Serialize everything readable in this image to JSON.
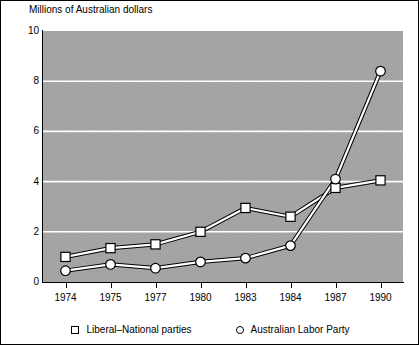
{
  "chart_data": {
    "type": "line",
    "title": "Millions of Australian dollars",
    "xlabel": "",
    "ylabel": "",
    "categories": [
      "1974",
      "1975",
      "1977",
      "1980",
      "1983",
      "1984",
      "1987",
      "1990"
    ],
    "series": [
      {
        "name": "Liberal–National parties",
        "marker": "square",
        "values": [
          1.0,
          1.35,
          1.5,
          2.0,
          2.95,
          2.6,
          3.75,
          4.05
        ]
      },
      {
        "name": "Australian Labor Party",
        "marker": "circle",
        "values": [
          0.45,
          0.7,
          0.55,
          0.8,
          0.95,
          1.45,
          4.1,
          8.4
        ]
      }
    ],
    "ylim": [
      0,
      10
    ],
    "y_ticks": [
      0,
      2,
      4,
      6,
      8,
      10
    ],
    "y_tick_labels": [
      "0",
      "2",
      "4",
      "6",
      "8",
      "10"
    ],
    "grid": "horizontal",
    "gridline_color": "#ffffff",
    "plot_background": "#a9a9a9",
    "line_color": "#ffffff",
    "line_outline_color": "#000000",
    "marker_fill": "#ffffff",
    "marker_edge": "#000000",
    "legend_position": "bottom"
  },
  "legend": {
    "entries": [
      {
        "label": "Liberal–National parties",
        "marker": "square"
      },
      {
        "label": "Australian Labor Party",
        "marker": "circle"
      }
    ]
  }
}
